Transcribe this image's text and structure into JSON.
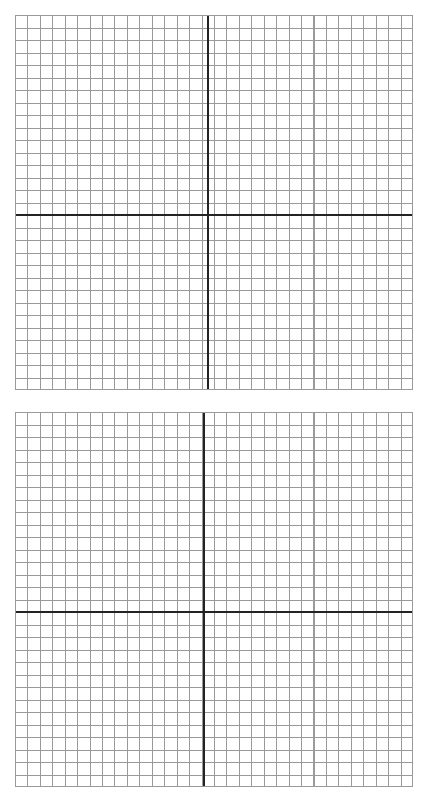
{
  "document": {
    "title": "Graph Paper Worksheet",
    "type": "blank-coordinate-grids",
    "page_width": 430,
    "page_height": 803,
    "background_color": "#ffffff"
  },
  "style": {
    "grid_line_color": "#9a9a9a",
    "axis_line_color": "#232323",
    "border_color": "#9a9a9a",
    "cell_size_px": 12.44,
    "grid_line_width_px": 1,
    "axis_line_width_px": 1.6
  },
  "panels": [
    {
      "id": "grid-top",
      "label": "Top coordinate grid",
      "left": 15,
      "top": 15,
      "width": 398,
      "height": 375,
      "columns": 32,
      "rows": 30,
      "x_axis_offset_px": 192,
      "y_axis_offset_px": 199,
      "quadrants": 4
    },
    {
      "id": "grid-bottom",
      "label": "Bottom coordinate grid",
      "left": 15,
      "top": 412,
      "width": 398,
      "height": 375,
      "columns": 32,
      "rows": 30,
      "x_axis_offset_px": 188,
      "y_axis_offset_px": 199,
      "quadrants": 4
    }
  ]
}
